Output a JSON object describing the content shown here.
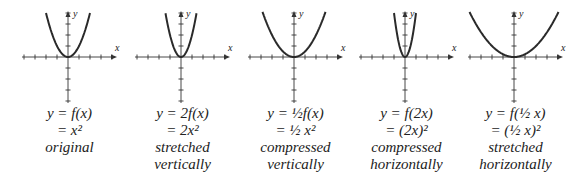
{
  "chart_data": [
    {
      "type": "line",
      "title": "original",
      "equation_line1": "y = f(x)",
      "equation_line2": "= x²",
      "label_line1": "original",
      "label_line2": "",
      "function": "x^2",
      "k_vert": 1,
      "k_horiz": 1,
      "xlabel": "x",
      "ylabel": "y",
      "xlim": [
        -4,
        4
      ],
      "ylim": [
        -4,
        4
      ],
      "grid": false
    },
    {
      "type": "line",
      "title": "stretched vertically",
      "equation_line1": "y = 2f(x)",
      "equation_line2": "= 2x²",
      "label_line1": "stretched",
      "label_line2": "vertically",
      "function": "2x^2",
      "k_vert": 2,
      "k_horiz": 1,
      "xlabel": "x",
      "ylabel": "y",
      "xlim": [
        -4,
        4
      ],
      "ylim": [
        -4,
        4
      ],
      "grid": false
    },
    {
      "type": "line",
      "title": "compressed vertically",
      "equation_line1": "y = ½f(x)",
      "equation_line2": "= ½ x²",
      "label_line1": "compressed",
      "label_line2": "vertically",
      "function": "0.5x^2",
      "k_vert": 0.5,
      "k_horiz": 1,
      "xlabel": "x",
      "ylabel": "y",
      "xlim": [
        -4,
        4
      ],
      "ylim": [
        -4,
        4
      ],
      "grid": false
    },
    {
      "type": "line",
      "title": "compressed horizontally",
      "equation_line1": "y = f(2x)",
      "equation_line2": "= (2x)²",
      "label_line1": "compressed",
      "label_line2": "horizontally",
      "function": "(2x)^2",
      "k_vert": 1,
      "k_horiz": 2,
      "xlabel": "x",
      "ylabel": "y",
      "xlim": [
        -4,
        4
      ],
      "ylim": [
        -4,
        4
      ],
      "grid": false
    },
    {
      "type": "line",
      "title": "stretched horizontally",
      "equation_line1": "y = f(½ x)",
      "equation_line2": "= (½ x)²",
      "label_line1": "stretched",
      "label_line2": "horizontally",
      "function": "(0.5x)^2",
      "k_vert": 1,
      "k_horiz": 0.5,
      "xlabel": "x",
      "ylabel": "y",
      "xlim": [
        -4,
        4
      ],
      "ylim": [
        -4,
        4
      ],
      "grid": false
    }
  ],
  "colors": {
    "curve": "#2a2a2a",
    "axis": "#333333",
    "text": "#222222"
  }
}
